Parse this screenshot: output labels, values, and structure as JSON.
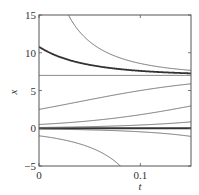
{
  "chart_data": {
    "type": "line",
    "title": "",
    "xlabel": "t",
    "ylabel": "x",
    "xlim": [
      0,
      0.15
    ],
    "ylim": [
      -5,
      15
    ],
    "xticks": [
      0,
      0.1
    ],
    "xtick_labels": [
      "0",
      "0.1"
    ],
    "yticks": [
      -5,
      0,
      5,
      10,
      15
    ],
    "ytick_labels": [
      "−5",
      "0",
      "5",
      "10",
      "15"
    ],
    "grid": false,
    "legend": null,
    "model": {
      "equation": "logistic",
      "rate": 15,
      "carrying_capacity": 7
    },
    "series": [
      {
        "name": "equilibrium x=7",
        "x0": 7,
        "style": "thin"
      },
      {
        "name": "equilibrium x=0",
        "x0": 0,
        "style": "thick"
      },
      {
        "name": "highlighted solution",
        "x0": 10.8,
        "style": "thick"
      },
      {
        "name": "solution from top 1",
        "x0": 40,
        "t0": 0.0,
        "style": "thin"
      },
      {
        "name": "solution from top 2",
        "x0": 15,
        "t0": 0.086,
        "style": "thin"
      },
      {
        "name": "solution x0=2.5",
        "x0": 2.5,
        "style": "thin"
      },
      {
        "name": "solution x0=0.5",
        "x0": 0.5,
        "style": "thin"
      },
      {
        "name": "solution x0=0.1",
        "x0": 0.1,
        "style": "thin"
      },
      {
        "name": "solution x0=-0.1",
        "x0": -0.1,
        "style": "thin"
      },
      {
        "name": "solution x0=-1",
        "x0": -1,
        "style": "thin"
      }
    ]
  }
}
